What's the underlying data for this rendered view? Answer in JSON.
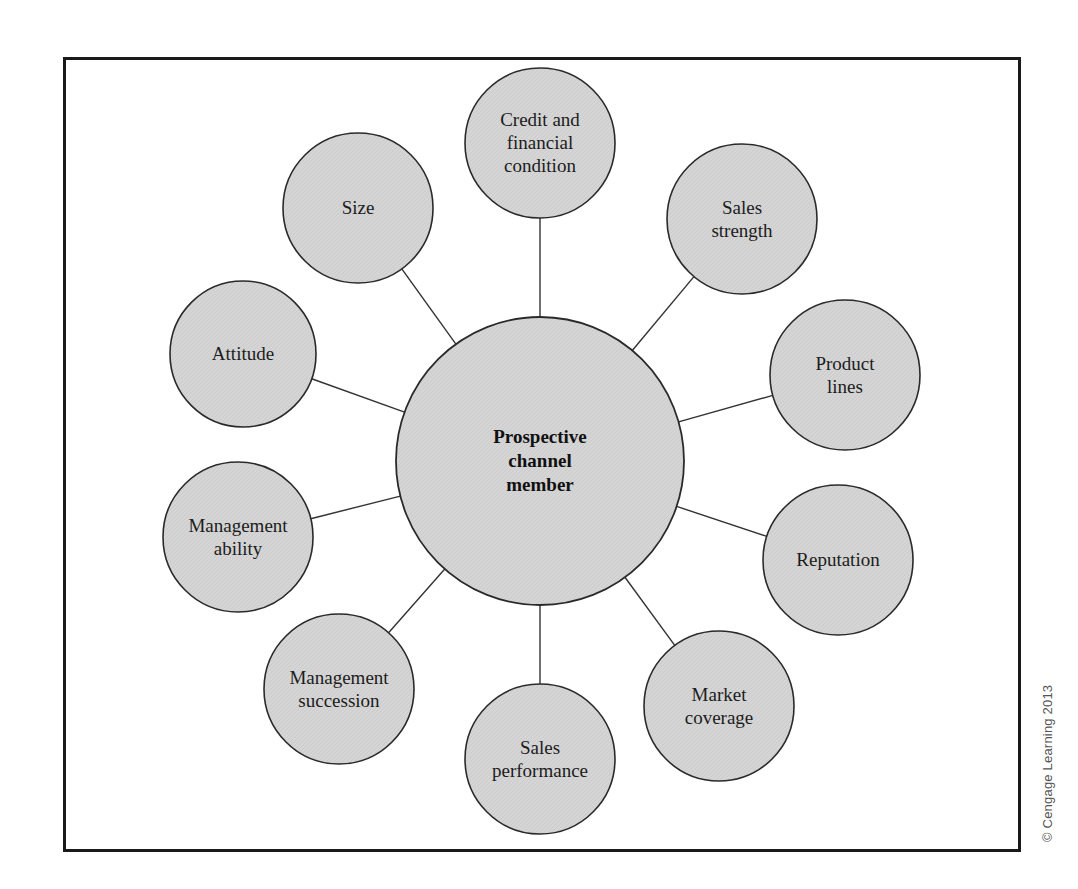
{
  "diagram": {
    "hub": {
      "label_lines": [
        "Prospective",
        "channel",
        "member"
      ],
      "cx": 540,
      "cy": 461,
      "r": 144
    },
    "nodes": [
      {
        "id": "credit",
        "label_lines": [
          "Credit and",
          "financial",
          "condition"
        ],
        "cx": 540,
        "cy": 143,
        "r": 75
      },
      {
        "id": "sales-strength",
        "label_lines": [
          "Sales",
          "strength"
        ],
        "cx": 742,
        "cy": 219,
        "r": 75
      },
      {
        "id": "product-lines",
        "label_lines": [
          "Product",
          "lines"
        ],
        "cx": 845,
        "cy": 375,
        "r": 75
      },
      {
        "id": "reputation",
        "label_lines": [
          "Reputation"
        ],
        "cx": 838,
        "cy": 560,
        "r": 75
      },
      {
        "id": "market-coverage",
        "label_lines": [
          "Market",
          "coverage"
        ],
        "cx": 719,
        "cy": 706,
        "r": 75
      },
      {
        "id": "sales-performance",
        "label_lines": [
          "Sales",
          "performance"
        ],
        "cx": 540,
        "cy": 759,
        "r": 75
      },
      {
        "id": "management-succession",
        "label_lines": [
          "Management",
          "succession"
        ],
        "cx": 339,
        "cy": 689,
        "r": 75
      },
      {
        "id": "management-ability",
        "label_lines": [
          "Management",
          "ability"
        ],
        "cx": 238,
        "cy": 537,
        "r": 75
      },
      {
        "id": "attitude",
        "label_lines": [
          "Attitude"
        ],
        "cx": 243,
        "cy": 354,
        "r": 73
      },
      {
        "id": "size",
        "label_lines": [
          "Size"
        ],
        "cx": 358,
        "cy": 208,
        "r": 75
      }
    ],
    "colors": {
      "fill": "#d4d4d4",
      "stroke": "#2a2a2a",
      "line": "#333333",
      "frame": "#1a1a1a"
    }
  },
  "credit_line": "© Cengage Learning 2013"
}
